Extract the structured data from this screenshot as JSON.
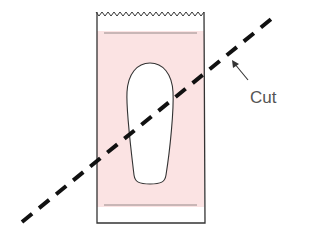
{
  "diagram": {
    "type": "illustration",
    "labels": {
      "cut": "Cut"
    },
    "colors": {
      "background": "#ffffff",
      "pouch_fill": "#fbe3e3",
      "outline": "#333333",
      "inner_line": "#8a8080",
      "cut_line": "#111111",
      "label": "#555555"
    },
    "elements": [
      {
        "name": "pouch",
        "description": "rectangular bag with zigzag serrated top edge"
      },
      {
        "name": "pink-region",
        "description": "shaded pink interior between two seal lines"
      },
      {
        "name": "insole-cutout",
        "description": "white rounded insole / slipper shape in center"
      },
      {
        "name": "cut-line",
        "description": "thick dashed diagonal line across pouch from lower-left to upper-right"
      },
      {
        "name": "cut-arrow",
        "description": "arrow pointing from label to dashed line"
      },
      {
        "name": "cut-label",
        "description": "text label 'Cut'"
      }
    ]
  }
}
